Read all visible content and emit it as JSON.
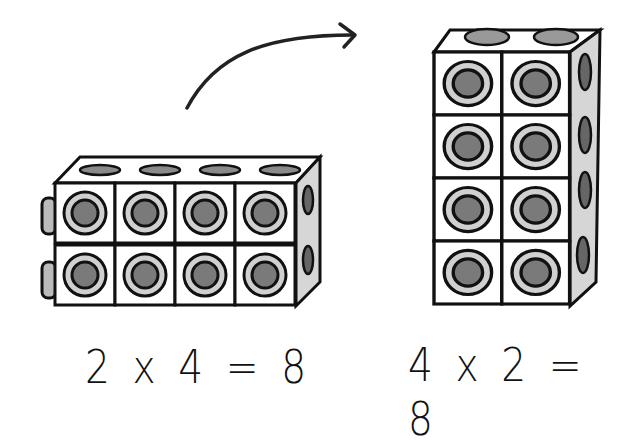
{
  "diagram": {
    "left_block": {
      "rows": 2,
      "cols": 4,
      "label": "2 x 4 = 8"
    },
    "right_block": {
      "rows": 4,
      "cols": 2,
      "label": "4 x 2 = 8"
    },
    "arrow": "curved-arrow-right",
    "colors": {
      "stroke": "#111111",
      "face": "#ffffff",
      "hole": "#7a7a7a",
      "ring": "#c8c8c8",
      "side": "#d6d6d6"
    }
  }
}
